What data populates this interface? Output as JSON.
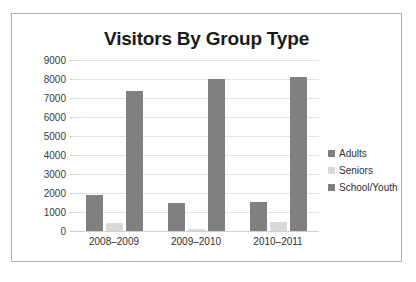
{
  "chart_data": {
    "type": "bar",
    "title": "Visitors By Group Type",
    "xlabel": "",
    "ylabel": "",
    "categories": [
      "2008–2009",
      "2009–2010",
      "2010–2011"
    ],
    "series": [
      {
        "name": "Adults",
        "values": [
          1900,
          1500,
          1550
        ],
        "color": "#808080"
      },
      {
        "name": "Seniors",
        "values": [
          400,
          100,
          450
        ],
        "color": "#d9d9d9"
      },
      {
        "name": "School/Youth",
        "values": [
          7370,
          8000,
          8100
        ],
        "color": "#808080"
      }
    ],
    "ylim": [
      0,
      9000
    ],
    "ytick_step": 1000,
    "yticks": [
      "9000",
      "8000",
      "7000",
      "6000",
      "5000",
      "4000",
      "3000",
      "2000",
      "1000",
      "0"
    ],
    "grid": true,
    "legend_position": "right"
  },
  "legend": {
    "items": [
      {
        "label": "Adults"
      },
      {
        "label": "Seniors"
      },
      {
        "label": "School/Youth"
      }
    ]
  },
  "style": {
    "frame_border": "#b0b0b0",
    "gridline": "#e2e2e2",
    "background": "#ffffff",
    "title_color": "#1a1a1a"
  }
}
